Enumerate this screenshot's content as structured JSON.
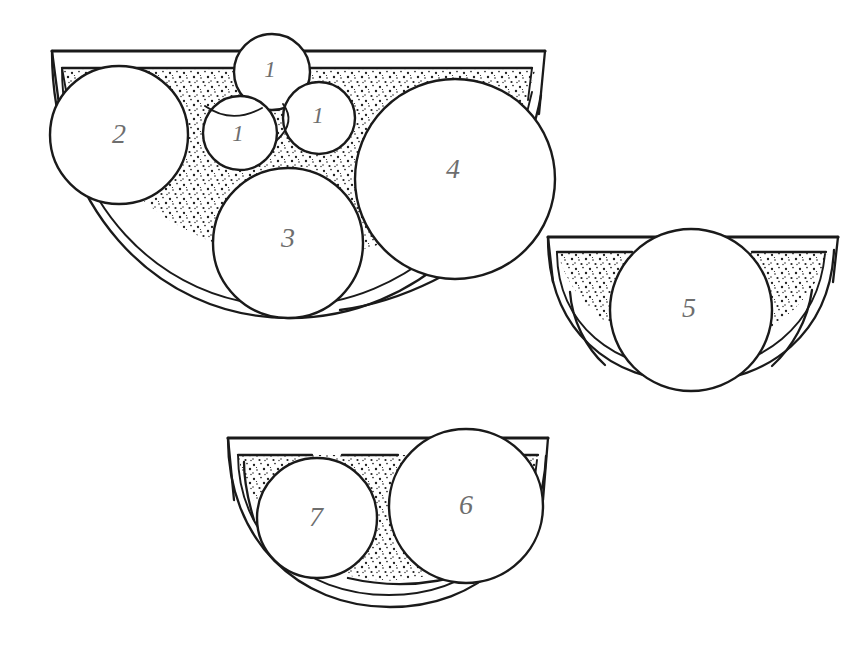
{
  "figure": {
    "background_color": "#ffffff",
    "ink_color": "#1a1a1a",
    "label_color": "#6e6e6e",
    "fill_pattern": "speckled-stipple",
    "width": 868,
    "height": 657
  },
  "containers": [
    {
      "id": "container-large",
      "name": "large-bowl",
      "rim_left_x": 52,
      "rim_right_x": 545,
      "rim_y": 51,
      "bottom_y": 318
    },
    {
      "id": "container-right",
      "name": "right-bowl",
      "rim_left_x": 548,
      "rim_right_x": 838,
      "rim_y": 237,
      "bottom_y": 382
    },
    {
      "id": "container-bottom",
      "name": "bottom-bowl",
      "rim_left_x": 228,
      "rim_right_x": 548,
      "rim_y": 438,
      "bottom_y": 607
    }
  ],
  "balls": [
    {
      "label": "1",
      "cx": 272,
      "cy": 72,
      "r": 38,
      "container": "large-bowl",
      "size": "small"
    },
    {
      "label": "1",
      "cx": 240,
      "cy": 133,
      "r": 37,
      "container": "large-bowl",
      "size": "small"
    },
    {
      "label": "1",
      "cx": 319,
      "cy": 118,
      "r": 36,
      "container": "large-bowl",
      "size": "small"
    },
    {
      "label": "2",
      "cx": 119,
      "cy": 135,
      "r": 69,
      "container": "large-bowl",
      "size": "large"
    },
    {
      "label": "3",
      "cx": 288,
      "cy": 243,
      "r": 75,
      "container": "large-bowl",
      "size": "large"
    },
    {
      "label": "4",
      "cx": 455,
      "cy": 179,
      "r": 100,
      "container": "large-bowl",
      "size": "large"
    },
    {
      "label": "5",
      "cx": 691,
      "cy": 310,
      "r": 81,
      "container": "right-bowl",
      "size": "large"
    },
    {
      "label": "6",
      "cx": 466,
      "cy": 506,
      "r": 77,
      "container": "bottom-bowl",
      "size": "large"
    },
    {
      "label": "7",
      "cx": 317,
      "cy": 518,
      "r": 60,
      "container": "bottom-bowl",
      "size": "medium"
    }
  ]
}
